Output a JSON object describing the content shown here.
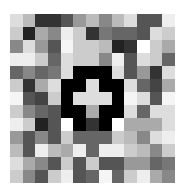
{
  "image": {
    "description": "13x13 grayscale pixel mosaic with a black ring enclosing a light plus/cross shape at center",
    "grid_size": [
      13,
      13
    ],
    "cells": [
      [
        "#dddddd",
        "#bbbbbb",
        "#333333",
        "#333333",
        "#555555",
        "#999999",
        "#bbbbbb",
        "#888888",
        "#bbbbbb",
        "#dddddd",
        "#555555",
        "#555555",
        "#eeeeee"
      ],
      [
        "#cccccc",
        "#222222",
        "#aaaaaa",
        "#888888",
        "#eeeeee",
        "#cccccc",
        "#333333",
        "#777777",
        "#666666",
        "#666666",
        "#555555",
        "#dddddd",
        "#cccccc"
      ],
      [
        "#888888",
        "#dddddd",
        "#999999",
        "#555555",
        "#f5f5f5",
        "#cccccc",
        "#cccccc",
        "#bbbbbb",
        "#222222",
        "#333333",
        "#ffffff",
        "#cccccc",
        "#aaaaaa"
      ],
      [
        "#eeeeee",
        "#eeeeee",
        "#cccccc",
        "#666666",
        "#dddddd",
        "#cccccc",
        "#cccccc",
        "#888888",
        "#eeeeee",
        "#555555",
        "#dddddd",
        "#cccccc",
        "#666666"
      ],
      [
        "#666666",
        "#888888",
        "#666666",
        "#777777",
        "#dddddd",
        "#000000",
        "#000000",
        "#000000",
        "#dddddd",
        "#555555",
        "#999999",
        "#333333",
        "#dddddd"
      ],
      [
        "#cccccc",
        "#333333",
        "#aaaaaa",
        "#dddddd",
        "#000000",
        "#000000",
        "#dddddd",
        "#000000",
        "#000000",
        "#dddddd",
        "#666666",
        "#444444",
        "#aaaaaa"
      ],
      [
        "#f5f5f5",
        "#555555",
        "#444444",
        "#cccccc",
        "#000000",
        "#dddddd",
        "#dddddd",
        "#dddddd",
        "#000000",
        "#f5f5f5",
        "#dddddd",
        "#555555",
        "#f5f5f5"
      ],
      [
        "#cccccc",
        "#888888",
        "#666666",
        "#555555",
        "#000000",
        "#000000",
        "#aaaaaa",
        "#000000",
        "#000000",
        "#dddddd",
        "#666666",
        "#dddddd",
        "#dddddd"
      ],
      [
        "#eeeeee",
        "#cccccc",
        "#222222",
        "#555555",
        "#ffffff",
        "#000000",
        "#333333",
        "#000000",
        "#ffffff",
        "#aaaaaa",
        "#aaaaaa",
        "#aaaaaa",
        "#dddddd"
      ],
      [
        "#999999",
        "#555555",
        "#888888",
        "#555555",
        "#cccccc",
        "#666666",
        "#666666",
        "#666666",
        "#cccccc",
        "#bbbbbb",
        "#888888",
        "#dddddd",
        "#eeeeee"
      ],
      [
        "#bbbbbb",
        "#555555",
        "#eeeeee",
        "#bbbbbb",
        "#aaaaaa",
        "#eeeeee",
        "#666666",
        "#eeeeee",
        "#eeeeee",
        "#cccccc",
        "#bbbbbb",
        "#888888",
        "#cccccc"
      ],
      [
        "#dddddd",
        "#aaaaaa",
        "#888888",
        "#555555",
        "#cccccc",
        "#555555",
        "#cccccc",
        "#555555",
        "#555555",
        "#999999",
        "#999999",
        "#666666",
        "#777777"
      ],
      [
        "#cccccc",
        "#888888",
        "#555555",
        "#cccccc",
        "#eeeeee",
        "#555555",
        "#666666",
        "#f5f5f5",
        "#666666",
        "#cccccc",
        "#eeeeee",
        "#aaaaaa",
        "#888888"
      ]
    ]
  }
}
